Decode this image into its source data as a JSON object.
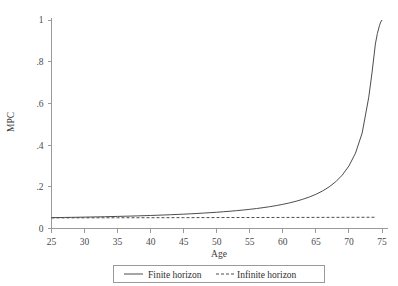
{
  "chart_data": {
    "type": "line",
    "title": "",
    "xlabel": "Age",
    "ylabel": "MPC",
    "xlim": [
      25,
      75
    ],
    "ylim": [
      0,
      1
    ],
    "xticks": [
      25,
      30,
      35,
      40,
      45,
      50,
      55,
      60,
      65,
      70,
      75
    ],
    "xtick_labels": [
      "25",
      "30",
      "35",
      "40",
      "45",
      "50",
      "55",
      "60",
      "65",
      "70",
      "75"
    ],
    "yticks": [
      0,
      0.2,
      0.4,
      0.6,
      0.8,
      1
    ],
    "ytick_labels": [
      "0",
      ".2",
      ".4",
      ".6",
      ".8",
      "1"
    ],
    "grid": false,
    "legend_position": "below-axis",
    "series": [
      {
        "name": "Finite horizon",
        "style": "solid",
        "color": "#4d4d4d",
        "x": [
          25,
          26,
          27,
          28,
          29,
          30,
          31,
          32,
          33,
          34,
          35,
          36,
          37,
          38,
          39,
          40,
          41,
          42,
          43,
          44,
          45,
          46,
          47,
          48,
          49,
          50,
          51,
          52,
          53,
          54,
          55,
          56,
          57,
          58,
          59,
          60,
          61,
          62,
          63,
          64,
          65,
          66,
          67,
          68,
          69,
          70,
          71,
          72,
          73,
          73.5,
          74,
          74.3,
          74.6,
          74.8,
          75
        ],
        "values": [
          0.052,
          0.0525,
          0.053,
          0.0535,
          0.054,
          0.0546,
          0.0552,
          0.0558,
          0.0565,
          0.0572,
          0.058,
          0.0588,
          0.0596,
          0.0605,
          0.0615,
          0.0625,
          0.0636,
          0.0648,
          0.066,
          0.0674,
          0.0688,
          0.0704,
          0.0721,
          0.0739,
          0.0759,
          0.078,
          0.0803,
          0.0828,
          0.0856,
          0.0886,
          0.092,
          0.0957,
          0.0999,
          0.1046,
          0.1099,
          0.1159,
          0.1228,
          0.1307,
          0.14,
          0.1509,
          0.164,
          0.1799,
          0.1995,
          0.2243,
          0.2565,
          0.3,
          0.362,
          0.458,
          0.63,
          0.75,
          0.885,
          0.935,
          0.972,
          0.99,
          1.0
        ]
      },
      {
        "name": "Infinite horizon",
        "style": "dashed",
        "color": "#4d4d4d",
        "x": [
          25,
          30,
          35,
          40,
          45,
          50,
          55,
          60,
          65,
          70,
          74
        ],
        "values": [
          0.051,
          0.0512,
          0.0515,
          0.0518,
          0.0521,
          0.0524,
          0.0527,
          0.053,
          0.0533,
          0.0536,
          0.0539
        ]
      }
    ],
    "legend": [
      {
        "label": "Finite horizon",
        "style": "solid"
      },
      {
        "label": "Infinite horizon",
        "style": "dashed"
      }
    ]
  }
}
